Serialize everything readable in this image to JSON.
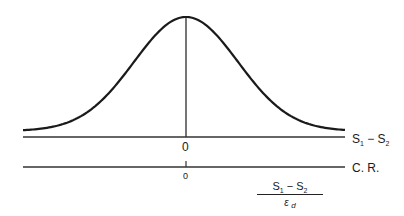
{
  "diagram": {
    "curve": {
      "type": "normal",
      "mean": 0
    },
    "axes": [
      {
        "label_main": "S",
        "label_sub1": "1",
        "label_op": " − S",
        "label_sub2": "2",
        "zero_label": "0"
      },
      {
        "label": "C. R.",
        "zero_label": "0"
      }
    ],
    "fraction": {
      "numerator_main": "S",
      "numerator_sub1": "1",
      "numerator_op": " − S",
      "numerator_sub2": "2",
      "denominator_main": "ε",
      "denominator_sub": "d"
    },
    "colors": {
      "line": "#1a1a1a",
      "background": "#ffffff"
    }
  }
}
